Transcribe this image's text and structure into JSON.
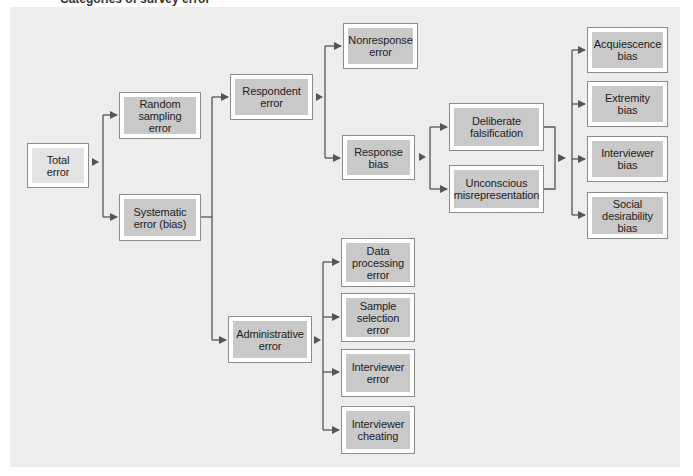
{
  "figure": {
    "caption_partial": "Categories of survey error"
  },
  "nodes": {
    "total": "Total\nerror",
    "random": "Random\nsampling\nerror",
    "systematic": "Systematic\nerror (bias)",
    "respondent": "Respondent\nerror",
    "administrative": "Administrative\nerror",
    "nonresponse": "Nonresponse\nerror",
    "response_bias": "Response\nbias",
    "deliberate": "Deliberate\nfalsification",
    "unconscious": "Unconscious\nmisrepresentation",
    "acquiescence": "Acquiescence\nbias",
    "extremity": "Extremity\nbias",
    "interviewer_bias": "Interviewer\nbias",
    "social_desirability": "Social\ndesirability\nbias",
    "data_processing": "Data\nprocessing\nerror",
    "sample_selection": "Sample\nselection\nerror",
    "interviewer_error": "Interviewer\nerror",
    "interviewer_cheating": "Interviewer\ncheating"
  },
  "colors": {
    "panel_bg": "#ededed",
    "node_fill": "#c9c9c9",
    "root_fill": "#e3e3e3",
    "connector": "#555555"
  },
  "edges": [
    [
      "total",
      "random"
    ],
    [
      "total",
      "systematic"
    ],
    [
      "systematic",
      "respondent"
    ],
    [
      "systematic",
      "administrative"
    ],
    [
      "respondent",
      "nonresponse"
    ],
    [
      "respondent",
      "response_bias"
    ],
    [
      "response_bias",
      "deliberate"
    ],
    [
      "response_bias",
      "unconscious"
    ],
    [
      "deliberate+unconscious",
      "acquiescence"
    ],
    [
      "deliberate+unconscious",
      "extremity"
    ],
    [
      "deliberate+unconscious",
      "interviewer_bias"
    ],
    [
      "deliberate+unconscious",
      "social_desirability"
    ],
    [
      "administrative",
      "data_processing"
    ],
    [
      "administrative",
      "sample_selection"
    ],
    [
      "administrative",
      "interviewer_error"
    ],
    [
      "administrative",
      "interviewer_cheating"
    ]
  ]
}
